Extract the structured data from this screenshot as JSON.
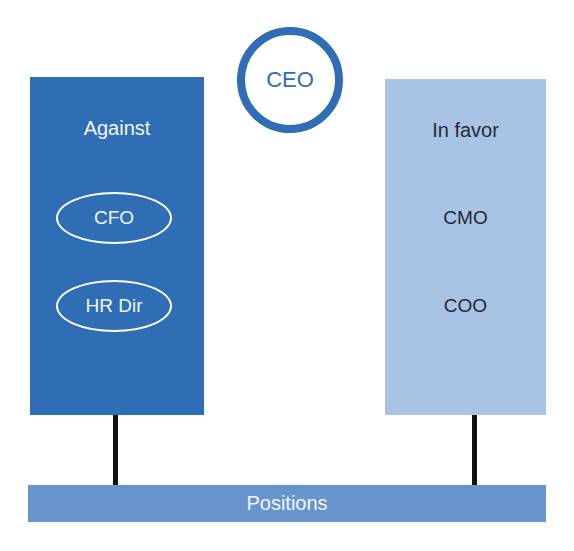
{
  "diagram": {
    "ceo": {
      "label": "CEO"
    },
    "against": {
      "title": "Against",
      "members": [
        "CFO",
        "HR Dir"
      ]
    },
    "in_favor": {
      "title": "In favor",
      "members": [
        "CMO",
        "COO"
      ]
    },
    "base": {
      "label": "Positions"
    },
    "colors": {
      "dark_blue": "#2f6db5",
      "light_blue": "#a9c3e4",
      "bar_blue": "#6794cc",
      "connector": "#111111"
    }
  }
}
